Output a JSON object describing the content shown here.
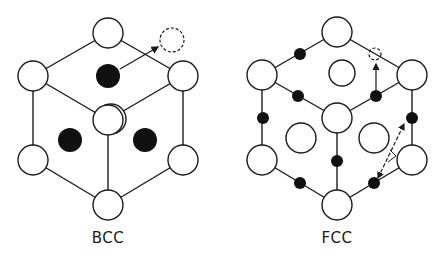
{
  "diagram": {
    "bcc": {
      "label": "BCC",
      "label_pos": [
        108,
        229
      ],
      "lines": [
        [
          108,
          33,
          33,
          76
        ],
        [
          108,
          33,
          183,
          76
        ],
        [
          33,
          76,
          108,
          120
        ],
        [
          183,
          76,
          108,
          120
        ],
        [
          33,
          76,
          33,
          160
        ],
        [
          183,
          76,
          183,
          160
        ],
        [
          108,
          120,
          108,
          205
        ],
        [
          33,
          160,
          108,
          205
        ],
        [
          183,
          160,
          108,
          205
        ]
      ],
      "atoms": [
        {
          "cx": 108,
          "cy": 33,
          "r": 15
        },
        {
          "cx": 33,
          "cy": 76,
          "r": 15
        },
        {
          "cx": 183,
          "cy": 76,
          "r": 15
        },
        {
          "cx": 111,
          "cy": 119,
          "r": 15
        },
        {
          "cx": 108,
          "cy": 120,
          "r": 15
        },
        {
          "cx": 33,
          "cy": 160,
          "r": 15
        },
        {
          "cx": 183,
          "cy": 160,
          "r": 15
        },
        {
          "cx": 108,
          "cy": 205,
          "r": 15
        }
      ],
      "interstitials": [
        {
          "cx": 108,
          "cy": 76,
          "r": 12
        },
        {
          "cx": 70,
          "cy": 140,
          "r": 12
        },
        {
          "cx": 145,
          "cy": 140,
          "r": 12
        }
      ],
      "vacancy": {
        "cx": 172,
        "cy": 40,
        "r": 12
      },
      "arrow": [
        120,
        69,
        158,
        47
      ]
    },
    "fcc": {
      "label": "FCC",
      "label_pos": [
        337,
        229
      ],
      "lines": [
        [
          337,
          32,
          262,
          75
        ],
        [
          337,
          32,
          412,
          75
        ],
        [
          262,
          75,
          337,
          118
        ],
        [
          412,
          75,
          337,
          118
        ],
        [
          262,
          75,
          262,
          160
        ],
        [
          412,
          75,
          412,
          160
        ],
        [
          337,
          118,
          337,
          205
        ],
        [
          262,
          160,
          337,
          205
        ],
        [
          412,
          160,
          337,
          205
        ]
      ],
      "atoms": [
        {
          "cx": 337,
          "cy": 32,
          "r": 15
        },
        {
          "cx": 262,
          "cy": 75,
          "r": 15
        },
        {
          "cx": 412,
          "cy": 75,
          "r": 15
        },
        {
          "cx": 337,
          "cy": 118,
          "r": 15
        },
        {
          "cx": 262,
          "cy": 160,
          "r": 15
        },
        {
          "cx": 412,
          "cy": 160,
          "r": 15
        },
        {
          "cx": 337,
          "cy": 205,
          "r": 15
        },
        {
          "cx": 342,
          "cy": 73,
          "r": 13
        },
        {
          "cx": 301,
          "cy": 138,
          "r": 15
        },
        {
          "cx": 374,
          "cy": 138,
          "r": 15
        }
      ],
      "interstitials": [
        {
          "cx": 300,
          "cy": 54,
          "r": 6
        },
        {
          "cx": 298,
          "cy": 96,
          "r": 6
        },
        {
          "cx": 376,
          "cy": 96,
          "r": 6
        },
        {
          "cx": 263,
          "cy": 118,
          "r": 6
        },
        {
          "cx": 412,
          "cy": 118,
          "r": 6
        },
        {
          "cx": 337,
          "cy": 161,
          "r": 6
        },
        {
          "cx": 300,
          "cy": 183,
          "r": 6
        },
        {
          "cx": 374,
          "cy": 183,
          "r": 6
        }
      ],
      "vacancy": {
        "cx": 375,
        "cy": 54,
        "r": 6
      },
      "arrows": [
        {
          "path": "M376,90 L376,64",
          "dashed": false
        },
        {
          "path": "M378,178 L404,124",
          "dashed": true,
          "double": true
        }
      ]
    }
  }
}
